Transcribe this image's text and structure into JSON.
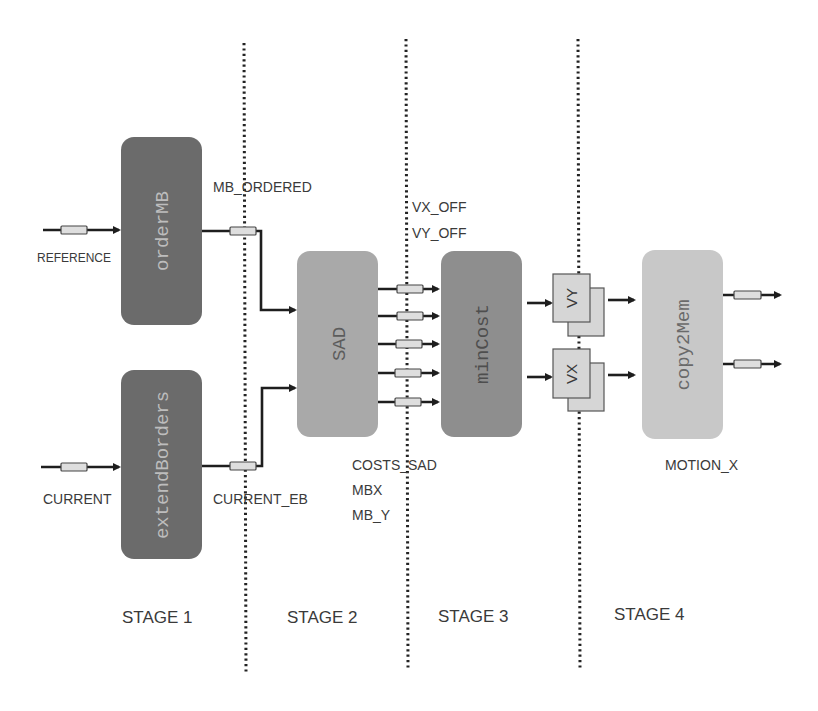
{
  "diagram": {
    "stages": [
      {
        "label": "STAGE 1"
      },
      {
        "label": "STAGE 2"
      },
      {
        "label": "STAGE 3"
      },
      {
        "label": "STAGE 4"
      }
    ],
    "blocks": {
      "orderMB": {
        "label": "orderMB",
        "color": "#6b6b6b"
      },
      "extendBorders": {
        "label": "extendBorders",
        "color": "#6b6b6b"
      },
      "sad": {
        "label": "SAD",
        "color": "#a9a9a9"
      },
      "minCost": {
        "label": "minCost",
        "color": "#8e8e8e"
      },
      "copy2Mem": {
        "label": "copy2Mem",
        "color": "#c8c8c8"
      }
    },
    "registers": {
      "vy": {
        "label": "VY"
      },
      "vx": {
        "label": "VX"
      }
    },
    "signals": {
      "reference": "REFERENCE",
      "current": "CURRENT",
      "mb_ordered": "MB_ORDERED",
      "current_eb": "CURRENT_EB",
      "vx_off": "VX_OFF",
      "vy_off": "VY_OFF",
      "costs_sad": "COSTS_SAD",
      "mbx": "MBX",
      "mb_y": "MB_Y",
      "motion_x": "MOTION_X"
    }
  }
}
